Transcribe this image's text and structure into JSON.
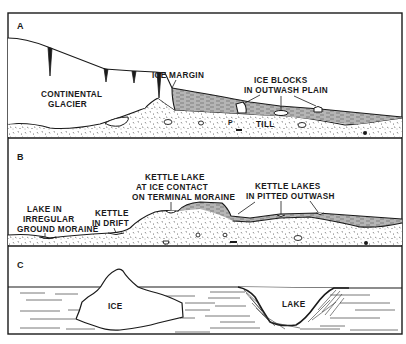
{
  "figure": {
    "panels": [
      {
        "id": "A",
        "label": "A",
        "annotations": {
          "glacier_line1": "CONTINENTAL",
          "glacier_line2": "GLACIER",
          "ice_margin": "ICE MARGIN",
          "ice_blocks_line1": "ICE BLOCKS",
          "ice_blocks_line2": "IN OUTWASH PLAIN",
          "till": "TILL"
        }
      },
      {
        "id": "B",
        "label": "B",
        "annotations": {
          "ground_moraine_line1": "LAKE IN",
          "ground_moraine_line2": "IRREGULAR",
          "ground_moraine_line3": "GROUND MORAINE",
          "kettle_drift_line1": "KETTLE",
          "kettle_drift_line2": "IN DRIFT",
          "terminal_line1": "KETTLE LAKE",
          "terminal_line2": "AT ICE CONTACT",
          "terminal_line3": "ON TERMINAL MORAINE",
          "pitted_line1": "KETTLE LAKES",
          "pitted_line2": "IN PITTED OUTWASH"
        }
      },
      {
        "id": "C",
        "label": "C",
        "annotations": {
          "ice": "ICE",
          "lake": "LAKE"
        }
      }
    ],
    "colors": {
      "ink": "#1a1a1a",
      "paper": "#ffffff",
      "outwash_shading": "#8a8a8a"
    }
  }
}
